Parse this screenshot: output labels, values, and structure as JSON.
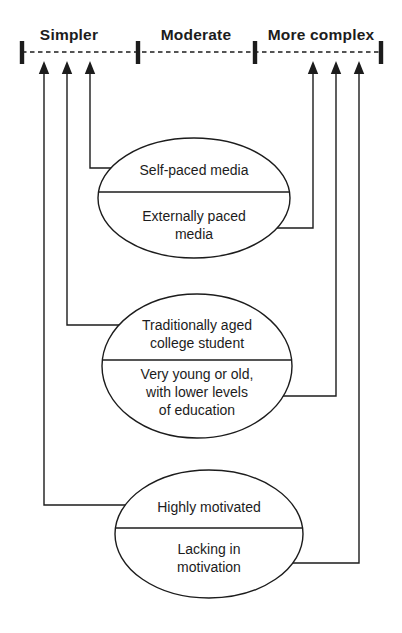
{
  "scale": {
    "labels": [
      "Simpler",
      "Moderate",
      "More complex"
    ],
    "tick_count": 4
  },
  "ellipses": [
    {
      "top_text": "Self-paced media",
      "bottom_text": "Externally paced\nmedia"
    },
    {
      "top_text": "Traditionally aged\ncollege student",
      "bottom_text": "Very young or old,\nwith lower levels\nof education"
    },
    {
      "top_text": "Highly motivated",
      "bottom_text": "Lacking in\nmotivation"
    }
  ],
  "arrows": {
    "direction": "up",
    "toward_simpler_count": 3,
    "toward_more_complex_count": 3
  },
  "colors": {
    "ink": "#1c1c1c",
    "background": "#ffffff"
  }
}
